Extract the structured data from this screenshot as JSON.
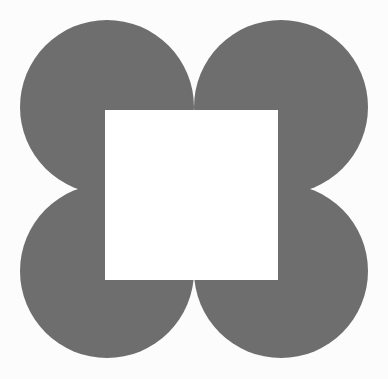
{
  "figure": {
    "canvas": {
      "width": 388,
      "height": 379,
      "background_color": "#fcfcfc"
    },
    "palette": {
      "circle_fill": "#6e6e6e",
      "square_fill": "#ffffff",
      "background": "#fcfcfc"
    },
    "shapes": {
      "circles": [
        {
          "name": "top-left-circle",
          "position": "top-left",
          "cx": 107,
          "cy": 107,
          "r": 87,
          "fill": "#6e6e6e"
        },
        {
          "name": "top-right-circle",
          "position": "top-right",
          "cx": 281,
          "cy": 107,
          "r": 87,
          "fill": "#6e6e6e"
        },
        {
          "name": "bottom-left-circle",
          "position": "bottom-left",
          "cx": 107,
          "cy": 271,
          "r": 87,
          "fill": "#6e6e6e"
        },
        {
          "name": "bottom-right-circle",
          "position": "bottom-right",
          "cx": 281,
          "cy": 271,
          "r": 87,
          "fill": "#6e6e6e"
        }
      ],
      "square": {
        "name": "center-white-square",
        "x": 105,
        "y": 110,
        "width": 173,
        "height": 170,
        "fill": "#ffffff"
      }
    },
    "counts": {
      "circle_count": 4,
      "square_count": 1
    }
  }
}
